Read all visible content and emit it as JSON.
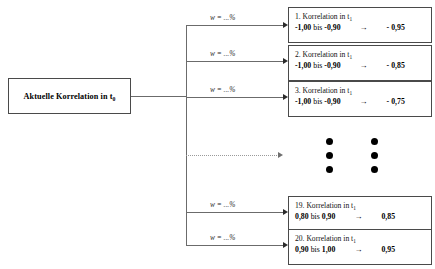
{
  "source": {
    "label_prefix": "Aktuelle Korrelation in t",
    "label_sub": "0"
  },
  "edge_label": "w = ...%",
  "labels": {
    "bis": "bis",
    "arrow": "→",
    "title_prefix": "Korrelation in t",
    "title_sub": "1"
  },
  "branches": [
    {
      "index": "1.",
      "title": "1. Korrelation in t",
      "title_sub": "1",
      "weight": "w = ...%",
      "range_from": "-1,00",
      "bis": "bis",
      "range_to": "-0,90",
      "arrow": "→",
      "value": "- 0,95"
    },
    {
      "index": "2.",
      "title": "2. Korrelation in t",
      "title_sub": "1",
      "weight": "w = ...%",
      "range_from": "-1,00",
      "bis": "bis",
      "range_to": "-0,90",
      "arrow": "→",
      "value": "- 0,85"
    },
    {
      "index": "3.",
      "title": "3. Korrelation in t",
      "title_sub": "1",
      "weight": "w = ...%",
      "range_from": "-1,00",
      "bis": "bis",
      "range_to": "-0,90",
      "arrow": "→",
      "value": "- 0,75"
    },
    {
      "index": "19.",
      "title": "19. Korrelation in t",
      "title_sub": "1",
      "weight": "w = ...%",
      "range_from": "0,80",
      "bis": "bis",
      "range_to": "0,90",
      "arrow": "→",
      "value": "0,85"
    },
    {
      "index": "20.",
      "title": "20. Korrelation in t",
      "title_sub": "1",
      "weight": "w = ...%",
      "range_from": "0,90",
      "bis": "bis",
      "range_to": "1,00",
      "arrow": "→",
      "value": "0,95"
    }
  ],
  "ellipsis": {
    "columns": 2,
    "dots_per_column": 3
  },
  "colors": {
    "box_border": "#4a4a4a",
    "line": "#6b6b6b",
    "arrow": "#2b2b2b",
    "dotted_line": "#9a9a9a",
    "dot": "#000000",
    "background": "#ffffff"
  }
}
